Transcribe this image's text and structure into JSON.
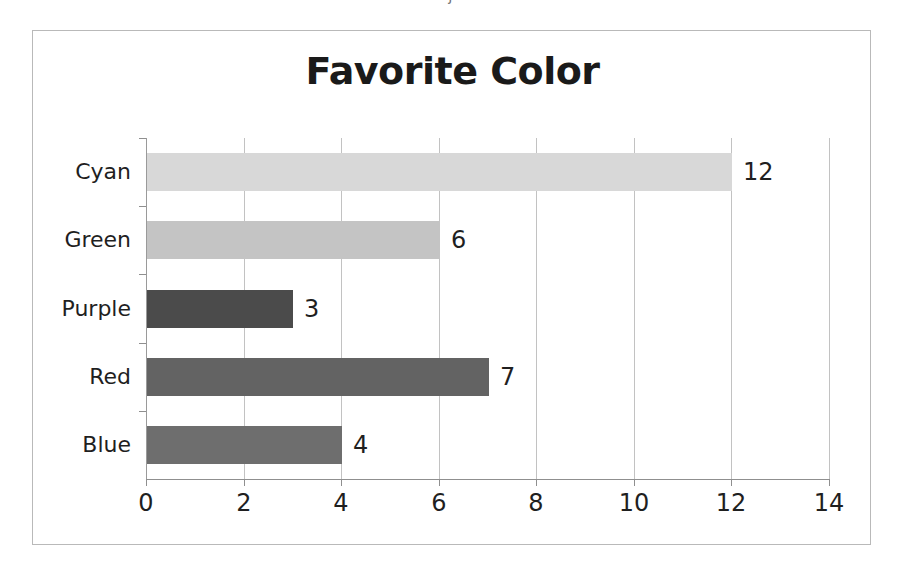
{
  "page": {
    "clipped_text_above": "j"
  },
  "chart_data": {
    "type": "bar",
    "orientation": "horizontal",
    "title": "Favorite Color",
    "xlabel": "",
    "ylabel": "",
    "categories": [
      "Blue",
      "Red",
      "Purple",
      "Green",
      "Cyan"
    ],
    "values": [
      4,
      7,
      3,
      6,
      12
    ],
    "bar_colors": [
      "#6e6e6e",
      "#636363",
      "#4b4b4b",
      "#c4c4c4",
      "#d8d8d8"
    ],
    "data_labels": [
      "4",
      "7",
      "3",
      "6",
      "12"
    ],
    "xlim": [
      0,
      14
    ],
    "x_ticks": [
      0,
      2,
      4,
      6,
      8,
      10,
      12,
      14
    ],
    "x_tick_labels": [
      "0",
      "2",
      "4",
      "6",
      "8",
      "10",
      "12",
      "14"
    ],
    "grid": "vertical",
    "legend": "none",
    "plot_background": "#ffffff",
    "axis_color": "#8f8f8f",
    "gridline_color": "#c2c2c2",
    "border_color": "#b9b9b9",
    "title_color": "#1a1a1a"
  }
}
